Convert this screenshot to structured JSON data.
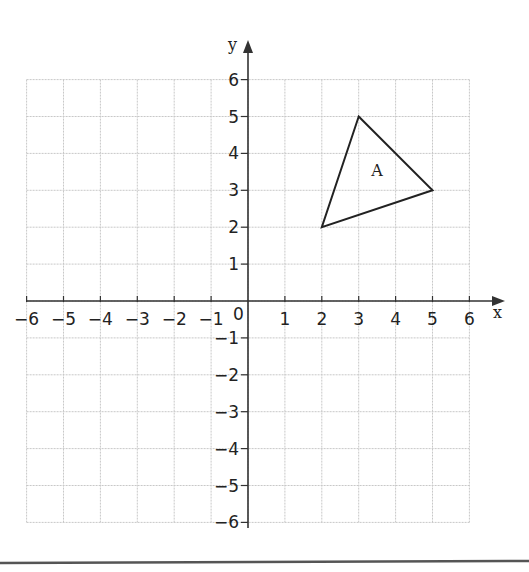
{
  "axes": {
    "x_label": "x",
    "y_label": "y",
    "origin_label": "0",
    "x_ticks": [
      "−6",
      "−5",
      "−4",
      "−3",
      "−2",
      "−1",
      "1",
      "2",
      "3",
      "4",
      "5",
      "6"
    ],
    "y_ticks": [
      "6",
      "5",
      "4",
      "3",
      "2",
      "1",
      "−1",
      "−2",
      "−3",
      "−4",
      "−5",
      "−6"
    ]
  },
  "shapes": [
    {
      "label": "A",
      "vertices": [
        [
          3,
          5
        ],
        [
          5,
          3
        ],
        [
          2,
          2
        ]
      ]
    }
  ],
  "chart_data": {
    "type": "scatter",
    "title": "",
    "xlabel": "x",
    "ylabel": "y",
    "xlim": [
      -6,
      6
    ],
    "ylim": [
      -6,
      6
    ],
    "grid": true,
    "x_ticks": [
      -6,
      -5,
      -4,
      -3,
      -2,
      -1,
      1,
      2,
      3,
      4,
      5,
      6
    ],
    "y_ticks": [
      -6,
      -5,
      -4,
      -3,
      -2,
      -1,
      1,
      2,
      3,
      4,
      5,
      6
    ],
    "series": [
      {
        "name": "Triangle A",
        "closed": true,
        "points": [
          {
            "x": 3,
            "y": 5
          },
          {
            "x": 5,
            "y": 3
          },
          {
            "x": 2,
            "y": 2
          }
        ]
      }
    ],
    "annotations": [
      {
        "text": "A",
        "x": 3.5,
        "y": 3.4
      }
    ]
  },
  "colors": {
    "grid": "#c8c8c8",
    "axis": "#333333",
    "shape": "#222222"
  }
}
